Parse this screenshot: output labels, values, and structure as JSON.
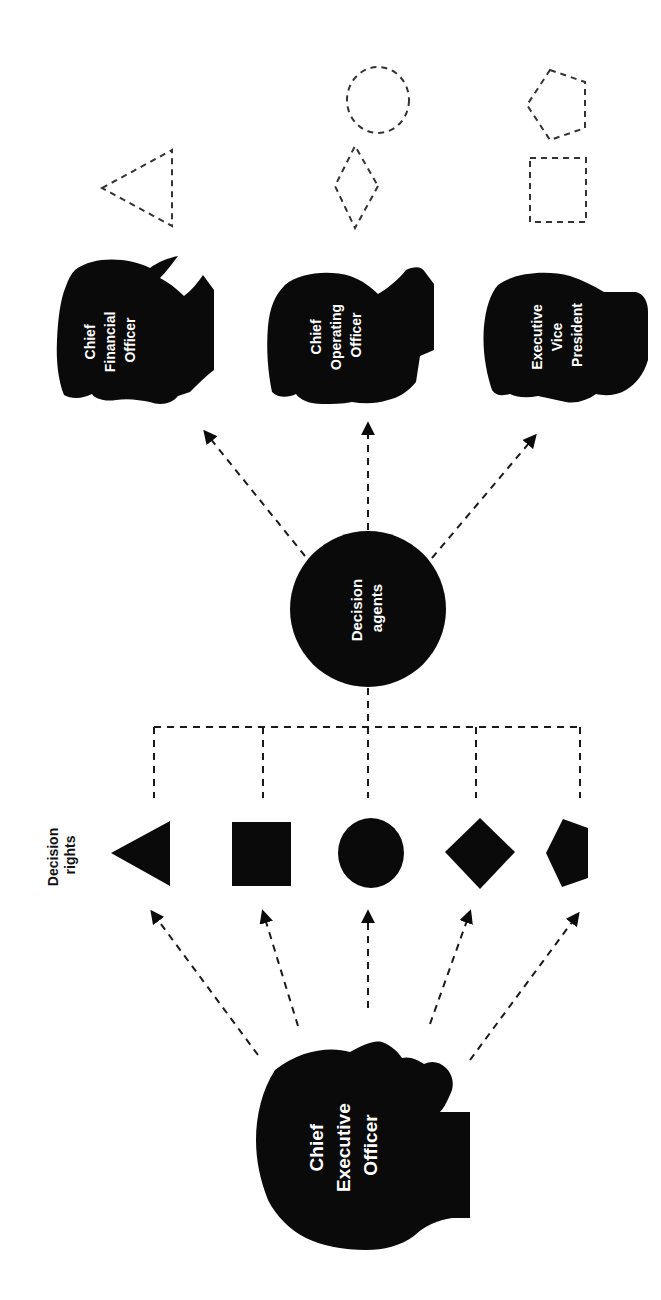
{
  "diagram": {
    "orientation": "rotated-90-ccw",
    "colors": {
      "ink": "#0a0a0a",
      "background": "#ffffff",
      "label_text": "#ffffff",
      "dashes": "#1a1a1a"
    },
    "ceo": {
      "line1": "Chief",
      "line2": "Executive",
      "line3": "Officer"
    },
    "decision_rights": {
      "label_line1": "Decision",
      "label_line2": "rights",
      "shapes": [
        "triangle",
        "square",
        "circle",
        "diamond",
        "pentagon"
      ]
    },
    "hub": {
      "line1": "Decision",
      "line2": "agents"
    },
    "executives": [
      {
        "line1": "Chief",
        "line2": "Financial",
        "line3": "Officer",
        "assigned_rights": [
          "triangle"
        ]
      },
      {
        "line1": "Chief",
        "line2": "Operating",
        "line3": "Officer",
        "assigned_rights": [
          "diamond",
          "circle"
        ]
      },
      {
        "line1": "Executive",
        "line2": "Vice",
        "line3": "President",
        "assigned_rights": [
          "square",
          "pentagon"
        ]
      }
    ]
  }
}
